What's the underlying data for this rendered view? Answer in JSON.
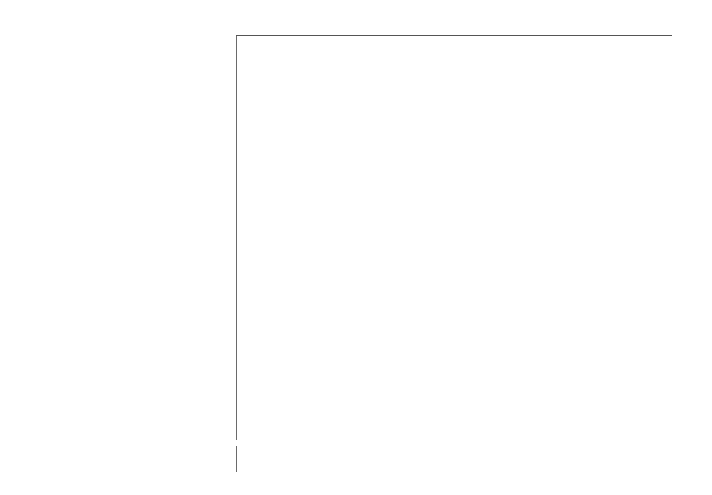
{
  "chart_data": {
    "type": "bar",
    "orientation": "horizontal",
    "title": "",
    "xlabel": "",
    "ylabel": "",
    "xlim": [
      0.0,
      1.0
    ],
    "grid": false,
    "legend": null,
    "tick_labels": [
      "0,0",
      "0,2",
      "0,4",
      "0,6",
      "0,8",
      "1,0"
    ],
    "tick_values": [
      0.0,
      0.2,
      0.4,
      0.6,
      0.8,
      1.0
    ],
    "bar_color": "#3b3b3b",
    "axis_color": "#555555",
    "footnote_marker": "*",
    "categories": [
      "Philippines, Rizal",
      "China, Shanghai",
      "Singapore: Chinese",
      "Brazil, Sao Paulo",
      "Hong Kong",
      "Japan, Miyagi",
      "Costa Rica",
      "India, Bombay",
      "Israel: All Jews",
      "Kuwait: Kuwaitis",
      "US, Los Angeles: Black",
      "US, Connecticut: Black",
      "Singapore: Indian",
      "Switzerland, Geneva",
      "Australia, New South Wales",
      "Canada",
      "France, Bas-Rhin",
      "German Democratic Republic",
      "Hungary, Szabolcs-Szatmar",
      "Italy, Varese",
      "Norway",
      "Spain, Navarra",
      "Sweden",
      "US, Los Angeles: Other White",
      "UK, England & Wales",
      "UK, Scotland",
      "Yugoslavia, Slovenia",
      "New Zealand: Maori",
      "Colombia, Cali",
      "US, Puerto Rico",
      "US, Los Angeles: Chinese",
      "US, Los Angeles: Japanese",
      "US, Connecticut: White",
      "Denmark",
      "FRG, Saarland",
      "Ireland, Southern",
      "Netherlands, Eindhoven",
      "Poland, Cracow City",
      "Romania, County Cluj",
      "Hawaii: Hawaiian"
    ],
    "values": [
      0.7,
      0.5,
      0.5,
      0.4,
      0.4,
      0.4,
      0.3,
      0.3,
      0.3,
      0.3,
      0.2,
      0.2,
      0.2,
      0.2,
      0.2,
      0.1,
      0.1,
      0.1,
      0.1,
      0.1,
      0.1,
      0.1,
      0.1,
      0.1,
      0.1,
      0.1,
      0.1,
      0.1,
      0.0,
      0.0,
      0.0,
      0.0,
      0.0,
      0.0,
      0.0,
      0.0,
      0.0,
      0.0,
      0.0,
      0.0
    ],
    "value_labels": [
      "0.7",
      "0.5",
      "0.5",
      "0.4",
      "0.4",
      "0.4",
      "0.3",
      "0.3",
      "0.3",
      "0.3",
      "0.2",
      "0.2",
      "0.2",
      "0.2",
      "0.2",
      "0.1",
      "0.1",
      "0.1",
      "0.1",
      "0.1",
      "0.1",
      "0.1",
      "0.1",
      "0.1",
      "0.1",
      "0.1",
      "0.1",
      "0.1",
      "0.0",
      "0.0",
      "0.0",
      "0.0",
      "0.0",
      "0.0",
      "0.0",
      "0.0",
      "0.0",
      "0.0",
      "0.0",
      "0.0"
    ],
    "markers": [
      "",
      ".",
      "",
      "",
      "",
      "",
      "",
      "",
      "",
      "*",
      "*",
      "*",
      "*",
      "*",
      "",
      "",
      "*",
      "",
      "*",
      "*",
      "",
      "*",
      "",
      "",
      "",
      "",
      "*",
      "*",
      "*",
      "*",
      "*",
      "*",
      "*",
      "*",
      "*",
      "*",
      "*",
      "*",
      "*",
      "*"
    ],
    "extra_group": {
      "categories": [
        "Brazil, Fortaleza",
        "UK, England & Wales"
      ],
      "values": [
        0.8,
        0.1
      ],
      "value_labels": [
        "0.8",
        "0.1"
      ],
      "markers": [
        "",
        ""
      ]
    }
  }
}
